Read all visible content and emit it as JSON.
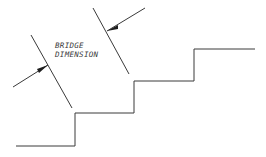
{
  "diagram": {
    "label_line1": "BRIDGE",
    "label_line2": "DIMENSION",
    "stroke_color": "#3a3a3a",
    "staircase_points": [
      [
        16,
        146
      ],
      [
        75,
        146
      ],
      [
        75,
        113
      ],
      [
        134,
        113
      ],
      [
        134,
        81
      ],
      [
        194,
        81
      ],
      [
        194,
        49
      ],
      [
        255,
        49
      ]
    ],
    "left_extension_line": [
      [
        31,
        35
      ],
      [
        72,
        108
      ]
    ],
    "left_arrow": {
      "from": [
        13,
        87
      ],
      "to": [
        48,
        65
      ]
    },
    "right_extension_line": [
      [
        93,
        8
      ],
      [
        129,
        74
      ]
    ],
    "right_arrow": {
      "from": [
        145,
        8
      ],
      "to": [
        107,
        31
      ]
    }
  }
}
